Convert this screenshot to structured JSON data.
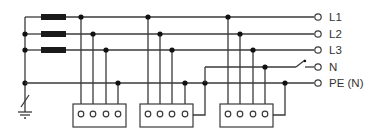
{
  "diagram": {
    "colors": {
      "wire": "#3a3a3a",
      "node": "#111111",
      "fuse": "#1a1a1a",
      "background": "#ffffff"
    },
    "lines": [
      {
        "id": "L1",
        "label": "L1",
        "y": 17,
        "fused": true
      },
      {
        "id": "L2",
        "label": "L2",
        "y": 34,
        "fused": true
      },
      {
        "id": "L3",
        "label": "L3",
        "y": 50,
        "fused": true
      },
      {
        "id": "N",
        "label": "N",
        "y": 67,
        "fused": false,
        "switch": true
      },
      {
        "id": "PE",
        "label": "PE (N)",
        "y": 83,
        "fused": false
      }
    ],
    "loads": [
      {
        "id": "load-1",
        "terminals": 4,
        "connects": [
          "L1",
          "L2",
          "L3",
          "PE"
        ]
      },
      {
        "id": "load-2",
        "terminals": 4,
        "connects": [
          "L1",
          "L2",
          "L3",
          "PE"
        ]
      },
      {
        "id": "load-3",
        "terminals": 4,
        "connects": [
          "L1",
          "L2",
          "L3",
          "N"
        ]
      }
    ],
    "symbols": [
      "fuse",
      "ground",
      "switch",
      "terminal"
    ]
  }
}
